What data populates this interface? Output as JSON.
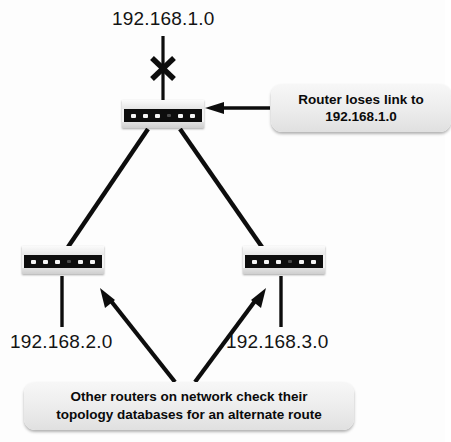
{
  "diagram": {
    "background_color": "#fdfdfd",
    "line_color": "#0d0d0d"
  },
  "labels": {
    "net_1": "192.168.1.0",
    "net_2": "192.168.2.0",
    "net_3": "192.168.3.0"
  },
  "callouts": {
    "link_loss": {
      "line1": "Router loses link to",
      "line2": "192.168.1.0"
    },
    "topology": {
      "line1": "Other routers on network check their",
      "line2": "topology databases for an alternate route"
    }
  },
  "devices": {
    "core_router": "router",
    "left_router": "router",
    "right_router": "router"
  },
  "markers": {
    "broken_link": "x-mark",
    "pointer_arrow": "left-arrow",
    "callout_arrow_left": "up-left-arrow",
    "callout_arrow_right": "up-right-arrow"
  }
}
